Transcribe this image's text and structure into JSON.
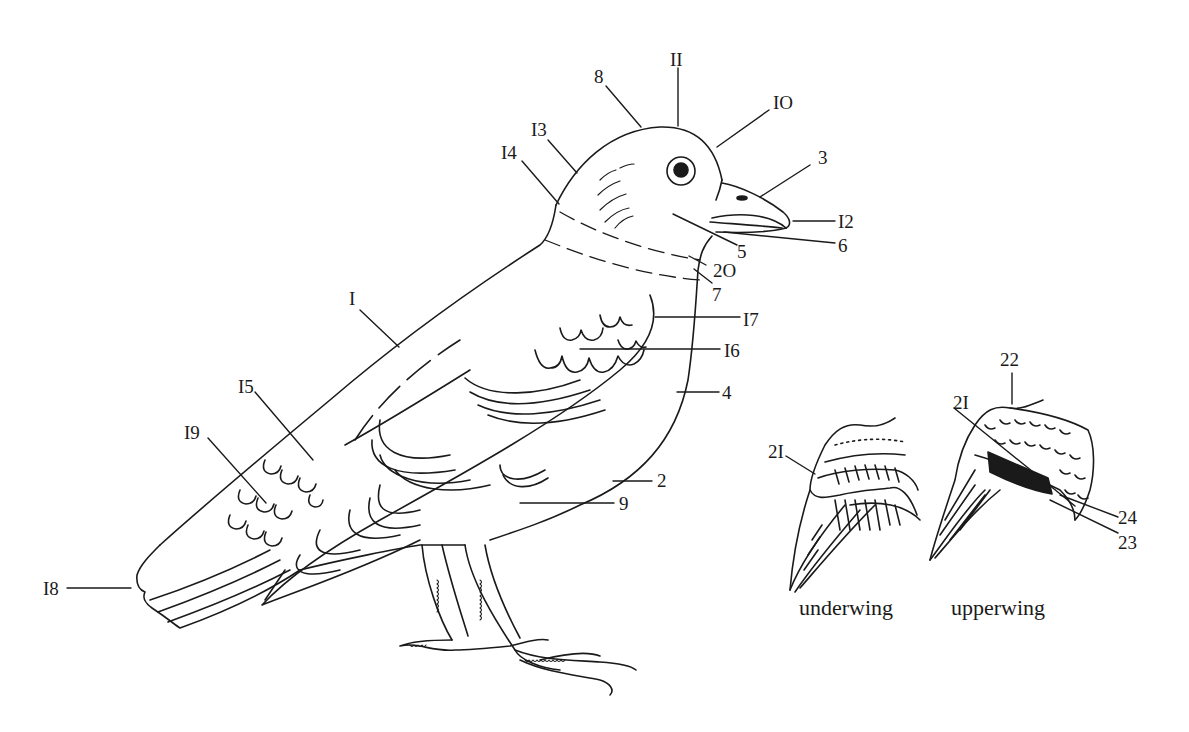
{
  "figure": {
    "stroke_color": "#1a1a1a",
    "background": "#ffffff"
  },
  "labels": {
    "l1": "I",
    "l2": "2",
    "l3": "3",
    "l4": "4",
    "l5": "5",
    "l6": "6",
    "l7": "7",
    "l8": "8",
    "l9": "9",
    "l10": "IO",
    "l11": "II",
    "l12": "I2",
    "l13": "I3",
    "l14": "I4",
    "l15": "I5",
    "l16": "I6",
    "l17": "I7",
    "l18": "I8",
    "l19": "I9",
    "l20": "2O",
    "l21a": "2I",
    "l21b": "2I",
    "l22": "22",
    "l23": "23",
    "l24": "24"
  },
  "captions": {
    "underwing": "underwing",
    "upperwing": "upperwing"
  }
}
